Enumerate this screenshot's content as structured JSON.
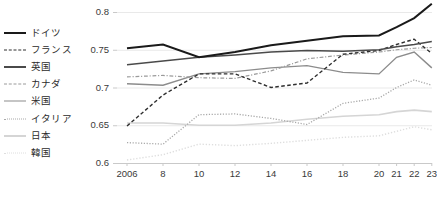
{
  "chart_data": {
    "type": "line",
    "title": "",
    "xlabel": "",
    "ylabel": "",
    "ylim": [
      0.6,
      0.8
    ],
    "yticks": [
      "0.6",
      "0.65",
      "0.7",
      "0.75",
      "0.8"
    ],
    "ytick_values": [
      0.6,
      0.65,
      0.7,
      0.75,
      0.8
    ],
    "grid": true,
    "legend_position": "left",
    "categories": [
      "2006",
      "8",
      "10",
      "12",
      "14",
      "16",
      "18",
      "20",
      "21",
      "22",
      "23"
    ],
    "x": [
      2006,
      2008,
      2010,
      2012,
      2014,
      2016,
      2018,
      2020,
      2021,
      2022,
      2023
    ],
    "series": [
      {
        "name": "ドイツ",
        "style": "solid",
        "color": "#1a1a1a",
        "width": 2.0,
        "values": [
          0.752,
          0.757,
          0.74,
          0.747,
          0.756,
          0.762,
          0.768,
          0.769,
          0.78,
          0.792,
          0.811
        ]
      },
      {
        "name": "フランス",
        "style": "dashed",
        "color": "#2e2e2e",
        "width": 1.4,
        "values": [
          0.649,
          0.69,
          0.718,
          0.718,
          0.7,
          0.706,
          0.744,
          0.749,
          0.757,
          0.764,
          0.745
        ]
      },
      {
        "name": "英国",
        "style": "solid",
        "color": "#4a4a4a",
        "width": 1.5,
        "values": [
          0.73,
          0.735,
          0.74,
          0.743,
          0.747,
          0.749,
          0.748,
          0.75,
          0.754,
          0.757,
          0.761
        ]
      },
      {
        "name": "カナダ",
        "style": "dashdot",
        "color": "#9a9a9a",
        "width": 1.2,
        "values": [
          0.714,
          0.716,
          0.713,
          0.712,
          0.722,
          0.738,
          0.743,
          0.747,
          0.75,
          0.752,
          0.753
        ]
      },
      {
        "name": "米国",
        "style": "solid",
        "color": "#8c8c8c",
        "width": 1.4,
        "values": [
          0.705,
          0.703,
          0.718,
          0.721,
          0.726,
          0.729,
          0.72,
          0.718,
          0.74,
          0.747,
          0.726
        ]
      },
      {
        "name": "イタリア",
        "style": "dotted",
        "color": "#a8a8a8",
        "width": 1.3,
        "values": [
          0.627,
          0.625,
          0.664,
          0.665,
          0.659,
          0.651,
          0.679,
          0.686,
          0.7,
          0.71,
          0.703
        ]
      },
      {
        "name": "日本",
        "style": "solid",
        "color": "#d5d5d5",
        "width": 1.6,
        "values": [
          0.653,
          0.653,
          0.65,
          0.65,
          0.653,
          0.658,
          0.662,
          0.664,
          0.668,
          0.67,
          0.668
        ]
      },
      {
        "name": "韓国",
        "style": "dotted",
        "color": "#dedede",
        "width": 1.4,
        "values": [
          0.604,
          0.611,
          0.625,
          0.623,
          0.626,
          0.63,
          0.634,
          0.636,
          0.642,
          0.648,
          0.644
        ]
      }
    ]
  },
  "legend": {
    "items": [
      {
        "label": "ドイツ"
      },
      {
        "label": "フランス"
      },
      {
        "label": "英国"
      },
      {
        "label": "カナダ"
      },
      {
        "label": "米国"
      },
      {
        "label": "イタリア"
      },
      {
        "label": "日本"
      },
      {
        "label": "韓国"
      }
    ]
  },
  "footer": {
    "source_note": ""
  }
}
